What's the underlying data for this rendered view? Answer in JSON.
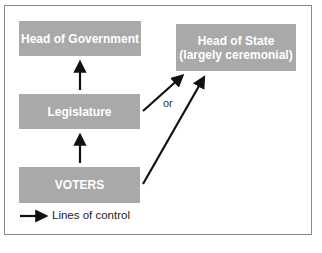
{
  "diagram": {
    "nodes": {
      "head_of_government": "Head of Government",
      "head_of_state_line1": "Head of State",
      "head_of_state_line2": "(largely ceremonial)",
      "legislature": "Legislature",
      "voters": "VOTERS"
    },
    "edges": [
      {
        "from": "Legislature",
        "to": "Head of Government"
      },
      {
        "from": "VOTERS",
        "to": "Legislature"
      },
      {
        "from": "Legislature",
        "to": "Head of State (largely ceremonial)"
      },
      {
        "from": "VOTERS",
        "to": "Head of State (largely ceremonial)"
      }
    ],
    "or_label": "or",
    "legend": {
      "label": "Lines of control"
    },
    "colors": {
      "box_fill": "#a9a9a9",
      "box_text": "#ffffff",
      "arrow": "#111111"
    }
  }
}
